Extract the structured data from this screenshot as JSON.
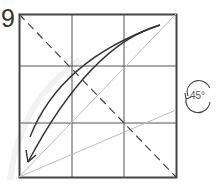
{
  "step": {
    "number": "9"
  },
  "rotation": {
    "label": "45°",
    "icon": "rotate-icon"
  },
  "colors": {
    "stroke": "#333333",
    "grid": "#555555",
    "guide": "#bdbdbd"
  }
}
